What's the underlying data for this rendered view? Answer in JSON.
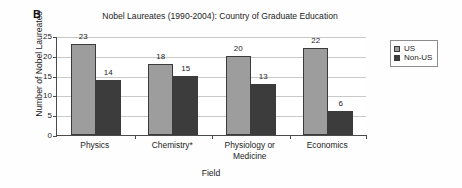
{
  "panel_label": "B",
  "axis_title_x": "Field",
  "axis_title_y": "Number of Nobel Laureates",
  "legend": {
    "items": [
      {
        "label": "US",
        "color": "#9d9d9d"
      },
      {
        "label": "Non-US",
        "color": "#3c3c3c"
      }
    ]
  },
  "chart_data": {
    "type": "bar",
    "title": "Nobel Laureates (1990-2004): Country of Graduate Education",
    "xlabel": "Field",
    "ylabel": "Number of Nobel Laureates",
    "categories": [
      "Physics",
      "Chemistry*",
      "Physiology or Medicine",
      "Economics"
    ],
    "category_lines": [
      [
        "Physics"
      ],
      [
        "Chemistry*"
      ],
      [
        "Physiology or",
        "Medicine"
      ],
      [
        "Economics"
      ]
    ],
    "series": [
      {
        "name": "US",
        "color": "#9d9d9d",
        "values": [
          23,
          18,
          20,
          22
        ]
      },
      {
        "name": "Non-US",
        "color": "#3c3c3c",
        "values": [
          14,
          15,
          13,
          6
        ]
      }
    ],
    "ylim": [
      0,
      25
    ],
    "yticks": [
      0,
      5,
      10,
      15,
      20,
      25
    ],
    "ytick_labels": [
      "0",
      "5",
      "10",
      "15",
      "20",
      "25"
    ],
    "grid": true,
    "grid_axis": "y",
    "legend_position": "right",
    "data_labels": true
  }
}
